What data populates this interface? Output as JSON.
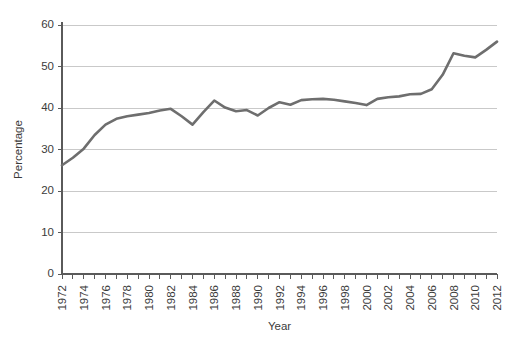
{
  "chart_data": {
    "type": "line",
    "title": "",
    "xlabel": "Year",
    "ylabel": "Percentage",
    "xlim": [
      1972,
      2012
    ],
    "ylim": [
      0,
      60
    ],
    "grid": "horizontal",
    "legend": "none",
    "line_color": "#6e6e6e",
    "x": [
      1972,
      1973,
      1974,
      1975,
      1976,
      1977,
      1978,
      1979,
      1980,
      1981,
      1982,
      1983,
      1984,
      1985,
      1986,
      1987,
      1988,
      1989,
      1990,
      1991,
      1992,
      1993,
      1994,
      1995,
      1996,
      1997,
      1998,
      1999,
      2000,
      2001,
      2002,
      2003,
      2004,
      2005,
      2006,
      2007,
      2008,
      2009,
      2010,
      2011,
      2012
    ],
    "values": [
      26.2,
      28.0,
      30.2,
      33.5,
      36.0,
      37.4,
      38.0,
      38.4,
      38.8,
      39.4,
      39.8,
      38.0,
      36.0,
      39.0,
      41.8,
      40.1,
      39.2,
      39.5,
      38.2,
      40.0,
      41.4,
      40.8,
      41.9,
      42.1,
      42.2,
      42.0,
      41.6,
      41.2,
      40.7,
      42.2,
      42.6,
      42.8,
      43.3,
      43.4,
      44.5,
      48.0,
      53.2,
      52.6,
      52.2,
      54.0,
      56.0
    ],
    "yticks": [
      0,
      10,
      20,
      30,
      40,
      50,
      60
    ],
    "xticks_labeled": [
      1972,
      1974,
      1976,
      1978,
      1980,
      1982,
      1984,
      1986,
      1988,
      1990,
      1992,
      1994,
      1996,
      1998,
      2000,
      2002,
      2004,
      2006,
      2008,
      2010,
      2012
    ],
    "ytick_labels": [
      "0",
      "10",
      "20",
      "30",
      "40",
      "50",
      "60"
    ],
    "xtick_labels": [
      "1972",
      "1974",
      "1976",
      "1978",
      "1980",
      "1982",
      "1984",
      "1986",
      "1988",
      "1990",
      "1992",
      "1994",
      "1996",
      "1998",
      "2000",
      "2002",
      "2004",
      "2006",
      "2008",
      "2010",
      "2012"
    ]
  }
}
